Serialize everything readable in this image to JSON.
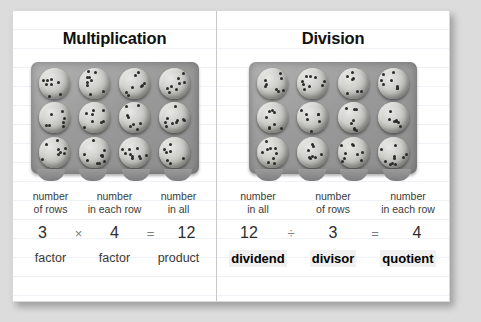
{
  "panels": {
    "multiplication": {
      "heading": "Multiplication",
      "array_image": {
        "alt": "baking tray with 12 chocolate chip cookies in 3 rows of 4",
        "rows": 3,
        "columns": 4,
        "total": 12
      },
      "labels": [
        {
          "line1": "number",
          "line2": "of rows"
        },
        {
          "line1": "number",
          "line2": "in each row"
        },
        {
          "line1": "number",
          "line2": "in all"
        }
      ],
      "equation": {
        "left": "3",
        "operator": "×",
        "right": "4",
        "equals": "=",
        "result": "12"
      },
      "terms": [
        "factor",
        "factor",
        "product"
      ]
    },
    "division": {
      "heading": "Division",
      "array_image": {
        "alt": "baking tray with 12 chocolate chip cookies in 3 rows of 4",
        "rows": 3,
        "columns": 4,
        "total": 12
      },
      "labels": [
        {
          "line1": "number",
          "line2": "in all"
        },
        {
          "line1": "number",
          "line2": "of rows"
        },
        {
          "line1": "number",
          "line2": "in each row"
        }
      ],
      "equation": {
        "left": "12",
        "operator": "÷",
        "right": "3",
        "equals": "=",
        "result": "4"
      },
      "terms": [
        "dividend",
        "divisor",
        "quotient"
      ]
    }
  },
  "colors": {
    "page_background": "#dcdcdc",
    "card_background": "#ffffff",
    "rule_line": "#eef1f5",
    "divider": "#c9c9c9",
    "heading_text": "#111111",
    "body_text": "#3a3a3a",
    "highlight": "#f0f0f0"
  }
}
